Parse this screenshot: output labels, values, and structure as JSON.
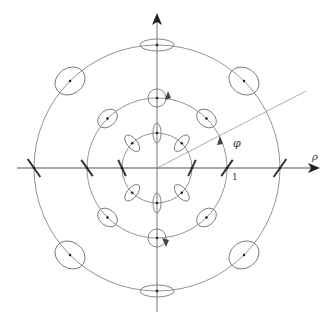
{
  "diagram": {
    "type": "polar-polarization-ellipses",
    "axes": {
      "horizontal_label": "ρ",
      "angle_label": "φ",
      "tick_label": "1"
    },
    "colors": {
      "stroke": "#777777",
      "axis": "#555555",
      "slash": "#333333",
      "background": "#ffffff"
    },
    "rings": [
      {
        "name": "inner",
        "radius": 35
      },
      {
        "name": "middle",
        "radius": 70
      },
      {
        "name": "outer",
        "radius": 123
      }
    ],
    "ellipse_count_per_ring": 8
  }
}
